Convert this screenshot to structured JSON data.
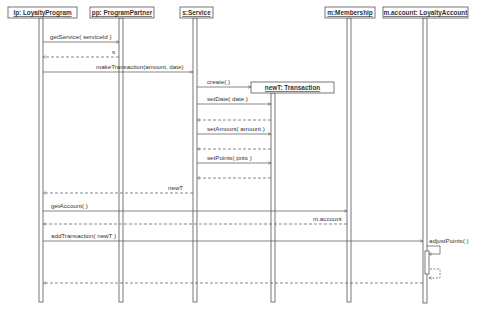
{
  "diagram": {
    "type": "uml-sequence",
    "colors": {
      "line": "#555555",
      "text": "#333333",
      "background": "#ffffff"
    },
    "lifelines": [
      {
        "id": "lp",
        "label": "lp: LoyaltyProgram",
        "x": 41,
        "box": [
          8,
          7,
          69,
          11
        ]
      },
      {
        "id": "pp",
        "label": "pp: ProgramPartner",
        "x": 121,
        "box": [
          90,
          7,
          64,
          11
        ]
      },
      {
        "id": "s",
        "label": "s:Service",
        "x": 195,
        "box": [
          180,
          7,
          33,
          11
        ]
      },
      {
        "id": "newT",
        "label": "newT: Transaction",
        "x": 273,
        "box": [
          251,
          82,
          83,
          11
        ]
      },
      {
        "id": "m",
        "label": "m:Membership",
        "x": 349,
        "box": [
          325,
          7,
          50,
          11
        ]
      },
      {
        "id": "acct",
        "label": "m.account: LoyaltyAccount",
        "x": 425,
        "box": [
          383,
          7,
          85,
          11
        ]
      }
    ],
    "messages": [
      {
        "label": "getService( serviceId )",
        "from": "lp",
        "to": "pp",
        "y": 42,
        "kind": "call"
      },
      {
        "label": "s",
        "from": "pp",
        "to": "lp",
        "y": 57,
        "kind": "return"
      },
      {
        "label": "makeTransaction(amount, date)",
        "from": "lp",
        "to": "s",
        "y": 72,
        "kind": "call"
      },
      {
        "label": "create( )",
        "from": "s",
        "to": "newT",
        "y": 87,
        "kind": "create"
      },
      {
        "label": "setDate( date )",
        "from": "s",
        "to": "newT",
        "y": 104,
        "kind": "call"
      },
      {
        "label": "",
        "from": "newT",
        "to": "s",
        "y": 120,
        "kind": "return"
      },
      {
        "label": "setAmount( amount )",
        "from": "s",
        "to": "newT",
        "y": 134,
        "kind": "call"
      },
      {
        "label": "",
        "from": "newT",
        "to": "s",
        "y": 149,
        "kind": "return"
      },
      {
        "label": "setPoints( pnts )",
        "from": "s",
        "to": "newT",
        "y": 163,
        "kind": "call"
      },
      {
        "label": "",
        "from": "newT",
        "to": "s",
        "y": 178,
        "kind": "return"
      },
      {
        "label": "newT",
        "from": "s",
        "to": "lp",
        "y": 193,
        "kind": "return"
      },
      {
        "label": "getAccount( )",
        "from": "lp",
        "to": "m",
        "y": 211,
        "kind": "call"
      },
      {
        "label": "m.account",
        "from": "m",
        "to": "lp",
        "y": 224,
        "kind": "return"
      },
      {
        "label": "addTransaction( newT )",
        "from": "lp",
        "to": "acct",
        "y": 241,
        "kind": "call"
      },
      {
        "label": "adjustPoints( )",
        "from": "acct",
        "to": "acct",
        "y": 249,
        "kind": "self-call"
      },
      {
        "label": "",
        "from": "acct",
        "to": "acct",
        "y": 278,
        "kind": "self-return"
      },
      {
        "label": "",
        "from": "acct",
        "to": "lp",
        "y": 283,
        "kind": "return"
      }
    ]
  }
}
